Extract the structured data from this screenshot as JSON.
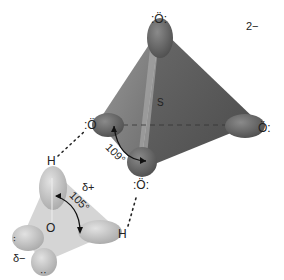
{
  "diagram": {
    "type": "molecular-diagram",
    "sulfate": {
      "charge": "2−",
      "central_atom": "S",
      "oxygens": [
        ":Ö:",
        ":Ö",
        "Ö:",
        ":Ö:"
      ],
      "bond_angle": "109°"
    },
    "water": {
      "central_atom": "O",
      "hydrogens": [
        "H",
        "H"
      ],
      "bond_angle": "105°",
      "partial_positive": "δ+",
      "partial_negative": "δ−",
      "lone_pairs": [
        "··",
        "··"
      ]
    },
    "hydrogen_bonds": 2,
    "colors": {
      "sulfate_fill": "#6e6e6e",
      "sulfate_dark": "#4a4a4a",
      "water_fill": "#c9c9c9",
      "background": "#ffffff"
    }
  }
}
